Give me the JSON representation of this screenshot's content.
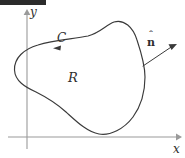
{
  "figure": {
    "kind": "math-diagram",
    "background_color": "#ffffff",
    "curve_color": "#3a3a3a",
    "axis_color": "#9a9a9a",
    "label_color": "#2e2e2e"
  },
  "axes": {
    "y_axis_label": "y",
    "x_axis_label": "x",
    "origin_px": {
      "x": 27,
      "y": 137
    },
    "y_axis_top_px": 12,
    "y_axis_bottom_px": 149,
    "x_axis_left_px": 8,
    "x_axis_right_px": 179
  },
  "labels": {
    "curve_label": "C",
    "region_label": "R",
    "normal_label": "n",
    "normal_hat": "ˆ",
    "normal_label_full": "n̂"
  },
  "curve": {
    "name": "C",
    "closed": true,
    "orientation": "counterclockwise",
    "orientation_arrow_at_px": {
      "x": 57,
      "y": 48
    },
    "orientation_arrow_direction": "left",
    "path": "M 14.5 70 C 14 58 24 49 38 45 C 54 40 74 39 88 36 C 100 33 106 25 114 22 C 124 19 133 27 137 40 C 141 52 145 64 145 77 C 145 92 141 106 133 117 C 124 129 110 136 99 134 C 87 132 76 121 66 112 C 56 103 46 97 36 92 C 25 87 15 81 14.5 70 Z"
  },
  "normal_vector": {
    "label": "n̂",
    "tail_px": {
      "x": 149,
      "y": 61
    },
    "tip_px": {
      "x": 176,
      "y": 45
    },
    "foot_on_curve_px": {
      "x": 143,
      "y": 66
    },
    "points": "outward"
  },
  "top_bar": {
    "name": "redaction-bar",
    "color": "#2b2b2b",
    "width_px": 46,
    "height_px": 5
  }
}
